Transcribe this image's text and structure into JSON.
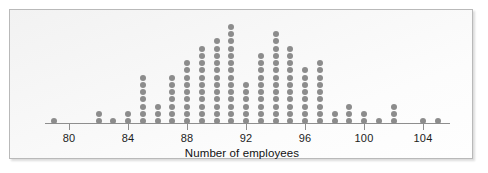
{
  "chart_data": {
    "type": "scatter",
    "plot_style": "dotplot",
    "title": "",
    "subtitle": "",
    "xlabel": "Number of employees",
    "ylabel": "",
    "grid": false,
    "legend": null,
    "xlim": [
      78.4,
      105.8
    ],
    "ylim": [
      0,
      15
    ],
    "tick_labels": [
      "80",
      "84",
      "88",
      "92",
      "96",
      "100",
      "104"
    ],
    "tick_values": [
      80,
      84,
      88,
      92,
      96,
      100,
      104
    ],
    "tick_interval": 4,
    "dot_color": "#8c8c8c",
    "axis_color": "#8e8e8e",
    "background_color": "#f7f7f7",
    "border_color": "#b9b9b9",
    "categories": [
      79,
      80,
      81,
      82,
      83,
      84,
      85,
      86,
      87,
      88,
      89,
      90,
      91,
      92,
      93,
      94,
      95,
      96,
      97,
      98,
      99,
      100,
      101,
      102,
      103,
      104,
      105
    ],
    "values": [
      1,
      0,
      0,
      2,
      1,
      2,
      7,
      3,
      7,
      9,
      11,
      12,
      14,
      6,
      10,
      13,
      11,
      8,
      9,
      2,
      3,
      2,
      1,
      3,
      0,
      1,
      1
    ],
    "annotations": []
  },
  "axis": {
    "title": "Number of employees"
  }
}
